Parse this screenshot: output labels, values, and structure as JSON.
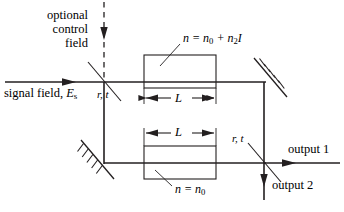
{
  "figure": {
    "width": 344,
    "height": 212,
    "background": "#ffffff",
    "line_color": "#231f20",
    "text_color": "#000000"
  },
  "labels": {
    "optional_control_field": "optional control field",
    "optional_control_field_lines": [
      "optional",
      "control",
      "field"
    ],
    "signal_field_text": "signal field,",
    "signal_field_symbol": "E",
    "signal_field_subscript": "s",
    "beamsplitter_1": "r, t",
    "beamsplitter_2": "r, t",
    "nonlinear_index_prefix": "n",
    "nonlinear_index_equals": "=",
    "nonlinear_index_n0": "n",
    "nonlinear_index_n0_sub": "0",
    "nonlinear_index_plus": "+",
    "nonlinear_index_n2": "n",
    "nonlinear_index_n2_sub": "2",
    "nonlinear_index_intensity": "I",
    "linear_index_prefix": "n",
    "linear_index_equals": "=",
    "linear_index_n0": "n",
    "linear_index_n0_sub": "0",
    "length_top": "L",
    "length_bottom": "L",
    "output_1": "output 1",
    "output_2": "output 2"
  },
  "components": {
    "beamsplitter_1_position": "104,82",
    "beamsplitter_2_position": "264,163",
    "mirror_top_right_position": "264,82",
    "mirror_bottom_left_position": "104,163",
    "medium_top": "n = n0 + n2 I",
    "medium_bottom": "n = n0",
    "arm_length_top": "L",
    "arm_length_bottom": "L"
  },
  "icons": {
    "signal_arrow": "arrow-right-icon",
    "control_arrow": "arrow-down-icon",
    "output1_arrow": "arrow-right-icon",
    "output2_arrow": "arrow-down-icon",
    "mirror_hatch": "mirror-hatch-icon",
    "dimension_arrow": "dimension-arrow-icon"
  }
}
